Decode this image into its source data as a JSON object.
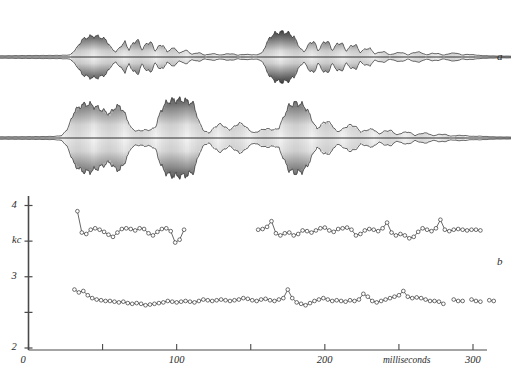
{
  "figure": {
    "kind": "speech-oscillogram-and-formant-plot",
    "panels": [
      {
        "id": "a",
        "label": "a",
        "type": "oscillogram",
        "baseline_y": 57
      },
      {
        "id": "b",
        "label": "b",
        "type": "formant-track-plot",
        "baseline_y": 138
      }
    ]
  },
  "labels": {
    "panel_a": "a",
    "panel_b": "b"
  },
  "axes": {
    "y": {
      "title": "kc",
      "ticks": [
        {
          "value": 4,
          "label": "4"
        },
        {
          "value": 3.5,
          "label": ""
        },
        {
          "value": 3,
          "label": "3"
        },
        {
          "value": 2.5,
          "label": ""
        },
        {
          "value": 2,
          "label": "2"
        }
      ],
      "min": 2,
      "max": 4.1
    },
    "x": {
      "title": "milliseconds",
      "ticks": [
        {
          "value": 0,
          "label": "0"
        },
        {
          "value": 50,
          "label": ""
        },
        {
          "value": 100,
          "label": "100"
        },
        {
          "value": 150,
          "label": ""
        },
        {
          "value": 200,
          "label": "200"
        },
        {
          "value": 250,
          "label": ""
        },
        {
          "value": 300,
          "label": "300"
        }
      ],
      "min": 0,
      "max": 310
    },
    "colors": {
      "axis": "#4a4a4a",
      "trace": "#2b2b2b",
      "marker_fill": "#ffffff"
    }
  },
  "chart_data": {
    "type": "line",
    "title": "",
    "xlabel": "milliseconds",
    "ylabel": "kc",
    "xlim": [
      0,
      310
    ],
    "ylim": [
      2,
      4.1
    ],
    "grid": false,
    "legend": null,
    "markers": "open-circle",
    "series": [
      {
        "name": "upper-formant-track",
        "segments": [
          {
            "x": [
              33,
              36,
              39,
              42,
              45,
              48,
              51,
              54,
              57,
              60,
              63,
              66,
              69,
              72,
              75,
              78,
              81,
              84,
              87,
              90,
              93,
              96,
              99,
              102,
              105
            ],
            "y": [
              3.92,
              3.62,
              3.6,
              3.66,
              3.68,
              3.66,
              3.63,
              3.59,
              3.56,
              3.62,
              3.67,
              3.68,
              3.67,
              3.65,
              3.68,
              3.67,
              3.61,
              3.58,
              3.63,
              3.67,
              3.68,
              3.64,
              3.48,
              3.52,
              3.66
            ]
          },
          {
            "x": [
              155,
              158,
              161,
              164,
              167,
              170,
              173,
              176,
              179,
              182,
              185,
              188,
              191,
              194,
              197,
              200,
              203,
              206,
              209,
              212,
              215,
              218,
              221,
              224,
              227,
              230,
              233,
              236,
              239,
              242,
              245,
              248,
              251,
              254,
              257,
              260,
              263,
              266,
              269,
              272,
              275,
              278,
              281,
              284,
              287,
              290,
              293,
              296,
              299,
              302,
              305
            ],
            "y": [
              3.66,
              3.67,
              3.7,
              3.78,
              3.61,
              3.58,
              3.61,
              3.62,
              3.58,
              3.6,
              3.65,
              3.64,
              3.62,
              3.65,
              3.68,
              3.69,
              3.65,
              3.63,
              3.67,
              3.68,
              3.69,
              3.66,
              3.58,
              3.6,
              3.65,
              3.67,
              3.66,
              3.64,
              3.68,
              3.76,
              3.62,
              3.58,
              3.6,
              3.58,
              3.54,
              3.56,
              3.63,
              3.68,
              3.66,
              3.64,
              3.68,
              3.8,
              3.66,
              3.64,
              3.66,
              3.67,
              3.66,
              3.65,
              3.66,
              3.66,
              3.65
            ]
          }
        ]
      },
      {
        "name": "lower-formant-track",
        "segments": [
          {
            "x": [
              31,
              34,
              37,
              40,
              43,
              46,
              49,
              52,
              55,
              58,
              61,
              64,
              67,
              70,
              73,
              76,
              79,
              82,
              85,
              88,
              91,
              94,
              97,
              100,
              103,
              106,
              109,
              112,
              115,
              118,
              121,
              124,
              127,
              130,
              133,
              136,
              139,
              142,
              145,
              148,
              151,
              154,
              157,
              160,
              163,
              166,
              169,
              172,
              175,
              178,
              181,
              184,
              187,
              190,
              193,
              196,
              199,
              202,
              205,
              208,
              211,
              214,
              217,
              220,
              223,
              226,
              229,
              232,
              235,
              238,
              241,
              244,
              247,
              250,
              253,
              256,
              259,
              262,
              265,
              268,
              271,
              274,
              277,
              280
            ],
            "y": [
              2.82,
              2.78,
              2.8,
              2.74,
              2.7,
              2.68,
              2.67,
              2.66,
              2.66,
              2.65,
              2.64,
              2.65,
              2.63,
              2.62,
              2.63,
              2.62,
              2.6,
              2.61,
              2.62,
              2.63,
              2.64,
              2.66,
              2.65,
              2.64,
              2.65,
              2.66,
              2.65,
              2.64,
              2.66,
              2.68,
              2.67,
              2.66,
              2.67,
              2.68,
              2.67,
              2.66,
              2.67,
              2.68,
              2.7,
              2.69,
              2.67,
              2.66,
              2.68,
              2.69,
              2.67,
              2.66,
              2.68,
              2.7,
              2.82,
              2.7,
              2.64,
              2.62,
              2.6,
              2.63,
              2.66,
              2.68,
              2.7,
              2.68,
              2.66,
              2.67,
              2.66,
              2.65,
              2.67,
              2.66,
              2.68,
              2.76,
              2.72,
              2.66,
              2.64,
              2.66,
              2.68,
              2.7,
              2.72,
              2.74,
              2.8,
              2.72,
              2.7,
              2.71,
              2.7,
              2.68,
              2.66,
              2.66,
              2.65,
              2.62
            ]
          },
          {
            "x": [
              287,
              290,
              293
            ],
            "y": [
              2.68,
              2.66,
              2.66
            ]
          },
          {
            "x": [
              299,
              302,
              305
            ],
            "y": [
              2.68,
              2.66,
              2.65
            ]
          },
          {
            "x": [
              311,
              314
            ],
            "y": [
              2.67,
              2.66
            ]
          }
        ]
      }
    ]
  },
  "waveforms": [
    {
      "name": "oscillogram-a",
      "label": "a",
      "baseline": 57,
      "max_amplitude": 30,
      "envelope": [
        {
          "x": 0,
          "a": 1.2
        },
        {
          "x": 20,
          "a": 1.4
        },
        {
          "x": 40,
          "a": 1.5
        },
        {
          "x": 60,
          "a": 1.6
        },
        {
          "x": 70,
          "a": 2.0
        },
        {
          "x": 76,
          "a": 8.0
        },
        {
          "x": 82,
          "a": 17.0
        },
        {
          "x": 88,
          "a": 20.0
        },
        {
          "x": 94,
          "a": 21.0
        },
        {
          "x": 100,
          "a": 20.0
        },
        {
          "x": 106,
          "a": 17.0
        },
        {
          "x": 112,
          "a": 8.0
        },
        {
          "x": 116,
          "a": 5.0
        },
        {
          "x": 120,
          "a": 10.0
        },
        {
          "x": 125,
          "a": 15.0
        },
        {
          "x": 129,
          "a": 7.0
        },
        {
          "x": 133,
          "a": 14.0
        },
        {
          "x": 138,
          "a": 17.0
        },
        {
          "x": 142,
          "a": 7.0
        },
        {
          "x": 146,
          "a": 13.0
        },
        {
          "x": 151,
          "a": 15.0
        },
        {
          "x": 155,
          "a": 6.0
        },
        {
          "x": 159,
          "a": 11.0
        },
        {
          "x": 163,
          "a": 12.0
        },
        {
          "x": 167,
          "a": 5.0
        },
        {
          "x": 171,
          "a": 8.0
        },
        {
          "x": 175,
          "a": 9.0
        },
        {
          "x": 179,
          "a": 3.5
        },
        {
          "x": 183,
          "a": 6.0
        },
        {
          "x": 187,
          "a": 6.5
        },
        {
          "x": 192,
          "a": 2.5
        },
        {
          "x": 196,
          "a": 4.0
        },
        {
          "x": 200,
          "a": 4.0
        },
        {
          "x": 205,
          "a": 1.8
        },
        {
          "x": 210,
          "a": 3.0
        },
        {
          "x": 215,
          "a": 3.2
        },
        {
          "x": 220,
          "a": 1.8
        },
        {
          "x": 226,
          "a": 3.0
        },
        {
          "x": 232,
          "a": 3.2
        },
        {
          "x": 238,
          "a": 1.8
        },
        {
          "x": 244,
          "a": 2.6
        },
        {
          "x": 250,
          "a": 2.4
        },
        {
          "x": 256,
          "a": 2.0
        },
        {
          "x": 262,
          "a": 4.0
        },
        {
          "x": 266,
          "a": 12.0
        },
        {
          "x": 270,
          "a": 20.0
        },
        {
          "x": 276,
          "a": 24.0
        },
        {
          "x": 282,
          "a": 25.0
        },
        {
          "x": 288,
          "a": 24.0
        },
        {
          "x": 294,
          "a": 20.0
        },
        {
          "x": 300,
          "a": 9.0
        },
        {
          "x": 304,
          "a": 5.0
        },
        {
          "x": 309,
          "a": 13.0
        },
        {
          "x": 314,
          "a": 16.0
        },
        {
          "x": 318,
          "a": 6.0
        },
        {
          "x": 323,
          "a": 14.0
        },
        {
          "x": 328,
          "a": 16.0
        },
        {
          "x": 332,
          "a": 6.5
        },
        {
          "x": 337,
          "a": 13.0
        },
        {
          "x": 342,
          "a": 14.0
        },
        {
          "x": 346,
          "a": 6.0
        },
        {
          "x": 351,
          "a": 11.0
        },
        {
          "x": 356,
          "a": 12.0
        },
        {
          "x": 360,
          "a": 4.5
        },
        {
          "x": 365,
          "a": 8.0
        },
        {
          "x": 370,
          "a": 8.5
        },
        {
          "x": 375,
          "a": 3.0
        },
        {
          "x": 380,
          "a": 5.0
        },
        {
          "x": 385,
          "a": 5.0
        },
        {
          "x": 390,
          "a": 2.0
        },
        {
          "x": 396,
          "a": 4.0
        },
        {
          "x": 402,
          "a": 4.5
        },
        {
          "x": 408,
          "a": 2.0
        },
        {
          "x": 414,
          "a": 4.5
        },
        {
          "x": 420,
          "a": 5.0
        },
        {
          "x": 426,
          "a": 2.0
        },
        {
          "x": 432,
          "a": 3.6
        },
        {
          "x": 438,
          "a": 3.4
        },
        {
          "x": 444,
          "a": 1.8
        },
        {
          "x": 450,
          "a": 3.6
        },
        {
          "x": 456,
          "a": 4.0
        },
        {
          "x": 462,
          "a": 2.0
        },
        {
          "x": 468,
          "a": 2.6
        },
        {
          "x": 474,
          "a": 2.2
        },
        {
          "x": 480,
          "a": 1.5
        },
        {
          "x": 488,
          "a": 1.2
        },
        {
          "x": 496,
          "a": 1.0
        },
        {
          "x": 505,
          "a": 0.9
        }
      ]
    },
    {
      "name": "oscillogram-b",
      "label": "",
      "baseline": 138,
      "max_amplitude": 40,
      "envelope": [
        {
          "x": 0,
          "a": 1.2
        },
        {
          "x": 20,
          "a": 1.3
        },
        {
          "x": 40,
          "a": 1.4
        },
        {
          "x": 55,
          "a": 1.6
        },
        {
          "x": 62,
          "a": 2.5
        },
        {
          "x": 68,
          "a": 10.0
        },
        {
          "x": 74,
          "a": 26.0
        },
        {
          "x": 80,
          "a": 32.0
        },
        {
          "x": 86,
          "a": 34.0
        },
        {
          "x": 92,
          "a": 33.0
        },
        {
          "x": 98,
          "a": 30.0
        },
        {
          "x": 104,
          "a": 27.0
        },
        {
          "x": 110,
          "a": 24.0
        },
        {
          "x": 114,
          "a": 30.0
        },
        {
          "x": 120,
          "a": 32.0
        },
        {
          "x": 126,
          "a": 22.0
        },
        {
          "x": 131,
          "a": 10.0
        },
        {
          "x": 136,
          "a": 7.0
        },
        {
          "x": 141,
          "a": 7.5
        },
        {
          "x": 146,
          "a": 8.0
        },
        {
          "x": 151,
          "a": 8.0
        },
        {
          "x": 156,
          "a": 12.0
        },
        {
          "x": 161,
          "a": 28.0
        },
        {
          "x": 167,
          "a": 36.0
        },
        {
          "x": 174,
          "a": 38.0
        },
        {
          "x": 181,
          "a": 38.0
        },
        {
          "x": 188,
          "a": 37.0
        },
        {
          "x": 194,
          "a": 33.0
        },
        {
          "x": 199,
          "a": 16.0
        },
        {
          "x": 204,
          "a": 7.0
        },
        {
          "x": 209,
          "a": 5.0
        },
        {
          "x": 214,
          "a": 10.0
        },
        {
          "x": 219,
          "a": 14.0
        },
        {
          "x": 224,
          "a": 12.0
        },
        {
          "x": 229,
          "a": 8.0
        },
        {
          "x": 234,
          "a": 11.0
        },
        {
          "x": 239,
          "a": 15.0
        },
        {
          "x": 244,
          "a": 13.0
        },
        {
          "x": 249,
          "a": 8.0
        },
        {
          "x": 254,
          "a": 5.0
        },
        {
          "x": 259,
          "a": 7.0
        },
        {
          "x": 264,
          "a": 9.0
        },
        {
          "x": 269,
          "a": 9.0
        },
        {
          "x": 274,
          "a": 8.0
        },
        {
          "x": 279,
          "a": 10.0
        },
        {
          "x": 284,
          "a": 22.0
        },
        {
          "x": 289,
          "a": 32.0
        },
        {
          "x": 295,
          "a": 35.0
        },
        {
          "x": 301,
          "a": 34.0
        },
        {
          "x": 307,
          "a": 29.0
        },
        {
          "x": 312,
          "a": 18.0
        },
        {
          "x": 317,
          "a": 9.0
        },
        {
          "x": 322,
          "a": 14.0
        },
        {
          "x": 327,
          "a": 17.0
        },
        {
          "x": 332,
          "a": 13.0
        },
        {
          "x": 337,
          "a": 6.0
        },
        {
          "x": 343,
          "a": 9.0
        },
        {
          "x": 349,
          "a": 13.0
        },
        {
          "x": 355,
          "a": 12.0
        },
        {
          "x": 361,
          "a": 6.0
        },
        {
          "x": 367,
          "a": 8.0
        },
        {
          "x": 373,
          "a": 9.0
        },
        {
          "x": 379,
          "a": 4.0
        },
        {
          "x": 385,
          "a": 7.0
        },
        {
          "x": 391,
          "a": 7.5
        },
        {
          "x": 397,
          "a": 3.0
        },
        {
          "x": 403,
          "a": 5.5
        },
        {
          "x": 409,
          "a": 6.0
        },
        {
          "x": 415,
          "a": 2.5
        },
        {
          "x": 421,
          "a": 4.5
        },
        {
          "x": 427,
          "a": 5.0
        },
        {
          "x": 433,
          "a": 2.2
        },
        {
          "x": 439,
          "a": 3.6
        },
        {
          "x": 445,
          "a": 3.6
        },
        {
          "x": 451,
          "a": 1.8
        },
        {
          "x": 458,
          "a": 2.6
        },
        {
          "x": 465,
          "a": 2.4
        },
        {
          "x": 472,
          "a": 1.6
        },
        {
          "x": 480,
          "a": 1.8
        },
        {
          "x": 488,
          "a": 1.4
        },
        {
          "x": 496,
          "a": 1.1
        },
        {
          "x": 505,
          "a": 1.0
        }
      ]
    }
  ]
}
